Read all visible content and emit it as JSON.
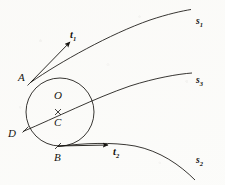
{
  "figure": {
    "background_color": "#fbfbf9",
    "ink_color": "#15130f"
  },
  "circle": {
    "center_label": "O",
    "center_point_label": "C",
    "cx": 60,
    "cy": 112,
    "r": 34
  },
  "points": [
    {
      "id": "A",
      "label": "A",
      "x": 30.5,
      "y": 82.5,
      "label_x": 18,
      "label_y": 72
    },
    {
      "id": "D",
      "label": "D",
      "x": 25.5,
      "y": 129.5,
      "label_x": 8,
      "label_y": 128
    },
    {
      "id": "B",
      "label": "B",
      "x": 58.0,
      "y": 146.0,
      "label_x": 54,
      "label_y": 152
    },
    {
      "id": "C",
      "label": "C",
      "x": 58.0,
      "y": 112.0,
      "label_x": 54,
      "label_y": 117
    },
    {
      "id": "O",
      "label": "O",
      "x": 58.0,
      "y": 94.0,
      "label_x": 54,
      "label_y": 90
    }
  ],
  "curves": [
    {
      "id": "s1",
      "label": "s",
      "subscript": "1",
      "label_x": 196,
      "label_y": 17,
      "description": "upper trajectory leaving the circle at point A"
    },
    {
      "id": "s3",
      "label": "s",
      "subscript": "3",
      "label_x": 196,
      "label_y": 76,
      "description": "middle trajectory through points D and C"
    },
    {
      "id": "s2",
      "label": "s",
      "subscript": "2",
      "label_x": 196,
      "label_y": 156,
      "description": "lower trajectory leaving the circle at point B"
    }
  ],
  "vectors": [
    {
      "id": "t1",
      "label": "t",
      "subscript": "1",
      "label_x": 70,
      "label_y": 30,
      "description": "tangent vector at point A pointing up and to the right"
    },
    {
      "id": "t2",
      "label": "t",
      "subscript": "2",
      "label_x": 113,
      "label_y": 147,
      "description": "tangent vector at point B pointing to the right"
    }
  ]
}
